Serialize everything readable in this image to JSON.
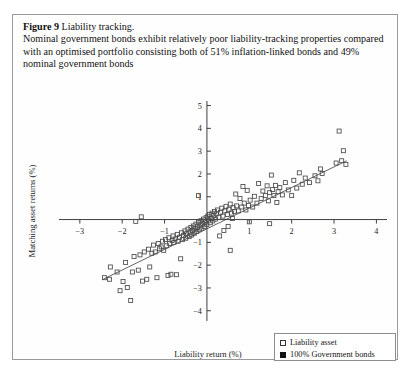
{
  "caption": {
    "figure_number": "Figure 9",
    "figure_title": "Liability tracking.",
    "description": "Nominal government bonds exhibit relatively poor liability-tracking properties compared with an optimised portfolio consisting both of 51% inflation-linked bonds and 49% nominal government bonds"
  },
  "legend": {
    "items": [
      {
        "label": "Liability asset",
        "marker": "open-square",
        "color": "#4a4a4a"
      },
      {
        "label": "100% Government bonds",
        "marker": "filled-square",
        "color": "#111111"
      }
    ]
  },
  "chart_data": {
    "type": "scatter",
    "title": "Liability tracking",
    "xlabel": "Liability return (%)",
    "ylabel": "Matching asset returns (%)",
    "xlim": [
      -3.35,
      4.25
    ],
    "ylim": [
      -4.45,
      5.2
    ],
    "xticks": [
      -3,
      -2,
      -1,
      1,
      2,
      3,
      4
    ],
    "yticks": [
      -4,
      -3,
      -2,
      -1,
      1,
      2,
      3,
      4,
      5
    ],
    "grid": false,
    "legend_position": "bottom-right",
    "axes_style": "crossed-at-origin",
    "series": [
      {
        "name": "Liability asset",
        "marker": "open-square",
        "color": "#4a4a4a",
        "points": [
          [
            -2.42,
            -2.55
          ],
          [
            -2.3,
            -2.62
          ],
          [
            -2.28,
            -2.08
          ],
          [
            -2.12,
            -2.3
          ],
          [
            -2.05,
            -3.12
          ],
          [
            -1.98,
            -2.72
          ],
          [
            -1.92,
            -1.88
          ],
          [
            -1.88,
            -2.98
          ],
          [
            -1.8,
            -3.55
          ],
          [
            -1.76,
            -2.3
          ],
          [
            -1.72,
            -1.62
          ],
          [
            -1.68,
            -0.08
          ],
          [
            -1.62,
            -2.22
          ],
          [
            -1.58,
            -1.55
          ],
          [
            -1.52,
            -2.7
          ],
          [
            -1.48,
            -1.42
          ],
          [
            -1.42,
            -2.62
          ],
          [
            -1.38,
            -1.3
          ],
          [
            -1.35,
            -2.08
          ],
          [
            -1.3,
            -1.48
          ],
          [
            -1.26,
            -1.12
          ],
          [
            -1.22,
            -1.42
          ],
          [
            -1.18,
            -2.55
          ],
          [
            -1.15,
            -1.05
          ],
          [
            -1.12,
            -1.28
          ],
          [
            -1.08,
            -1.2
          ],
          [
            -1.05,
            -0.95
          ],
          [
            -1.02,
            -1.35
          ],
          [
            -0.98,
            -0.88
          ],
          [
            -0.95,
            -1.15
          ],
          [
            -0.92,
            -2.45
          ],
          [
            -0.9,
            -0.8
          ],
          [
            -0.88,
            -1.05
          ],
          [
            -0.85,
            -2.4
          ],
          [
            -0.82,
            -0.92
          ],
          [
            -0.8,
            -0.72
          ],
          [
            -0.78,
            -1.0
          ],
          [
            -0.75,
            -0.85
          ],
          [
            -0.72,
            -2.42
          ],
          [
            -0.7,
            -0.65
          ],
          [
            -0.68,
            -0.95
          ],
          [
            -0.65,
            -0.78
          ],
          [
            -0.62,
            -1.72
          ],
          [
            -0.6,
            -0.58
          ],
          [
            -0.58,
            -0.88
          ],
          [
            -0.55,
            -0.7
          ],
          [
            -0.52,
            -0.5
          ],
          [
            -0.5,
            -0.82
          ],
          [
            -0.48,
            -0.62
          ],
          [
            -0.45,
            -0.42
          ],
          [
            -0.42,
            -0.75
          ],
          [
            -0.4,
            -0.55
          ],
          [
            -0.38,
            -0.35
          ],
          [
            -0.36,
            -0.68
          ],
          [
            -0.34,
            -0.48
          ],
          [
            -0.32,
            -0.28
          ],
          [
            -0.3,
            -0.6
          ],
          [
            -0.28,
            -0.4
          ],
          [
            -0.26,
            -0.2
          ],
          [
            -0.24,
            -0.52
          ],
          [
            -0.22,
            -0.32
          ],
          [
            -0.2,
            -0.12
          ],
          [
            -0.18,
            -0.45
          ],
          [
            -0.16,
            -0.25
          ],
          [
            -0.14,
            -0.05
          ],
          [
            -0.12,
            -0.38
          ],
          [
            -0.1,
            -0.18
          ],
          [
            -0.08,
            0.02
          ],
          [
            -0.06,
            -0.3
          ],
          [
            -0.04,
            -0.1
          ],
          [
            -0.02,
            0.08
          ],
          [
            0.0,
            -0.22
          ],
          [
            0.02,
            0.15
          ],
          [
            0.04,
            -0.02
          ],
          [
            0.06,
            0.22
          ],
          [
            0.08,
            -0.14
          ],
          [
            0.1,
            0.05
          ],
          [
            0.12,
            0.28
          ],
          [
            0.14,
            -0.06
          ],
          [
            0.16,
            0.18
          ],
          [
            0.18,
            0.35
          ],
          [
            0.2,
            0.02
          ],
          [
            0.22,
            0.25
          ],
          [
            0.25,
            0.42
          ],
          [
            0.28,
            0.1
          ],
          [
            0.3,
            -0.72
          ],
          [
            0.32,
            0.32
          ],
          [
            0.35,
            0.5
          ],
          [
            0.38,
            0.15
          ],
          [
            0.4,
            -0.48
          ],
          [
            0.42,
            0.38
          ],
          [
            0.45,
            0.58
          ],
          [
            0.48,
            0.22
          ],
          [
            0.5,
            -0.3
          ],
          [
            0.52,
            0.45
          ],
          [
            0.55,
            0.68
          ],
          [
            0.58,
            0.28
          ],
          [
            0.6,
            0.05
          ],
          [
            0.62,
            0.52
          ],
          [
            0.65,
            0.35
          ],
          [
            0.68,
            1.12
          ],
          [
            0.7,
            0.6
          ],
          [
            0.74,
            0.38
          ],
          [
            0.78,
            0.92
          ],
          [
            0.82,
            0.55
          ],
          [
            0.85,
            1.45
          ],
          [
            0.88,
            0.72
          ],
          [
            0.92,
            0.42
          ],
          [
            0.95,
            1.28
          ],
          [
            0.98,
            0.62
          ],
          [
            1.0,
            -0.1
          ],
          [
            1.02,
            0.85
          ],
          [
            1.08,
            0.55
          ],
          [
            1.12,
            1.02
          ],
          [
            1.18,
            0.72
          ],
          [
            1.22,
            1.58
          ],
          [
            1.28,
            0.92
          ],
          [
            1.32,
            1.25
          ],
          [
            1.38,
            1.05
          ],
          [
            1.42,
            1.48
          ],
          [
            1.45,
            0.82
          ],
          [
            1.48,
            1.18
          ],
          [
            1.52,
            1.95
          ],
          [
            1.55,
            1.32
          ],
          [
            1.58,
            1.05
          ],
          [
            1.62,
            1.5
          ],
          [
            1.65,
            0.75
          ],
          [
            1.68,
            1.22
          ],
          [
            1.72,
            1.4
          ],
          [
            1.78,
            1.08
          ],
          [
            1.85,
            1.62
          ],
          [
            1.92,
            1.3
          ],
          [
            2.0,
            1.05
          ],
          [
            2.05,
            1.72
          ],
          [
            2.12,
            1.38
          ],
          [
            2.18,
            2.05
          ],
          [
            2.25,
            1.55
          ],
          [
            2.32,
            1.82
          ],
          [
            2.42,
            1.62
          ],
          [
            2.55,
            1.92
          ],
          [
            2.62,
            1.7
          ],
          [
            2.68,
            2.22
          ],
          [
            2.72,
            2.02
          ],
          [
            3.05,
            2.48
          ],
          [
            3.12,
            3.88
          ],
          [
            3.18,
            2.58
          ],
          [
            3.22,
            3.02
          ],
          [
            3.28,
            2.42
          ],
          [
            -1.55,
            0.12
          ],
          [
            -0.2,
            1.05
          ],
          [
            0.55,
            -1.35
          ],
          [
            1.48,
            -0.18
          ]
        ]
      },
      {
        "name": "100% Government bonds",
        "marker": "filled-square",
        "color": "#111111",
        "points": []
      }
    ],
    "trend_line": {
      "name": "fit",
      "x_start": -2.45,
      "y_start": -2.62,
      "x_end": 3.3,
      "y_end": 2.58
    }
  }
}
